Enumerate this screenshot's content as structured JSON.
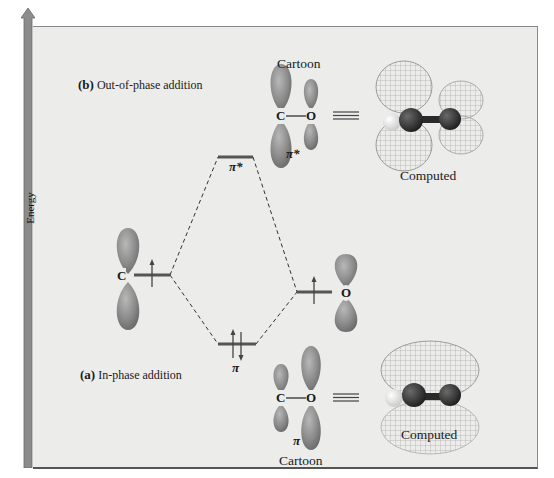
{
  "axis": {
    "label": "Energy",
    "direction": "up"
  },
  "panels": {
    "b": {
      "marker": "(b)",
      "title": "Out-of-phase addition",
      "cartoon_label": "Cartoon",
      "computed_label": "Computed",
      "orbital_label": "π*",
      "bond": {
        "left_atom": "C",
        "right_atom": "O"
      }
    },
    "a": {
      "marker": "(a)",
      "title": "In-phase addition",
      "cartoon_label": "Cartoon",
      "computed_label": "Computed",
      "orbital_label": "π",
      "bond": {
        "left_atom": "C",
        "right_atom": "O"
      }
    }
  },
  "energy_levels": {
    "carbon": {
      "atom": "C",
      "electrons": "↑"
    },
    "oxygen": {
      "atom": "O",
      "electrons": "↑"
    },
    "pi_star": {
      "label": "π*",
      "electrons": ""
    },
    "pi": {
      "label": "π",
      "electrons": "↑↓"
    }
  },
  "equals_symbol": "≡",
  "colors": {
    "background": "#ececeb",
    "level_line": "#555555",
    "lobe": "#8a8a8a",
    "arrow": "#8c8c8c"
  }
}
